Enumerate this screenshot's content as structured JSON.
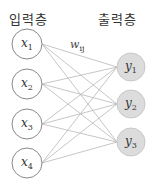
{
  "diagram": {
    "input_layer": {
      "title": "입력층",
      "nodes": [
        {
          "var": "x",
          "sub": "1",
          "cx": 27,
          "cy": 44
        },
        {
          "var": "x",
          "sub": "2",
          "cx": 27,
          "cy": 84
        },
        {
          "var": "x",
          "sub": "3",
          "cx": 27,
          "cy": 124
        },
        {
          "var": "x",
          "sub": "4",
          "cx": 27,
          "cy": 163
        }
      ]
    },
    "output_layer": {
      "title": "출력층",
      "nodes": [
        {
          "var": "y",
          "sub": "1",
          "cx": 131,
          "cy": 67
        },
        {
          "var": "y",
          "sub": "2",
          "cx": 131,
          "cy": 104
        },
        {
          "var": "y",
          "sub": "3",
          "cx": 131,
          "cy": 142
        }
      ]
    },
    "weight_label": {
      "var": "w",
      "sub": "ij"
    },
    "colors": {
      "input_fill": "#ffffff",
      "input_stroke": "#8a8a8a",
      "output_fill": "#dcdcdc",
      "output_stroke": "#c8c8c8",
      "edge": "#b8b8b8"
    }
  }
}
